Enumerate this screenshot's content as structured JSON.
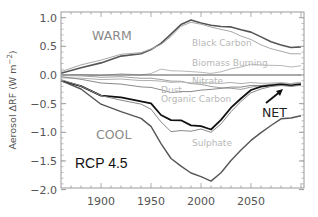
{
  "chart_data": {
    "type": "line",
    "title": "",
    "scenario_label": "RCP 4.5",
    "xlabel": "",
    "ylabel": "Aerosol ΔRF (W m⁻²)",
    "ylabel_parts": {
      "main": "Aerosol ΔRF (W m",
      "exp": "−2",
      "close": ")"
    },
    "xlim": [
      1860,
      2100
    ],
    "ylim": [
      -2.05,
      1.1
    ],
    "xticks": [
      1900,
      1950,
      2000,
      2050
    ],
    "xtick_labels": [
      "1900",
      "1950",
      "2000",
      "2050"
    ],
    "yticks": [
      1.0,
      0.5,
      0.0,
      -0.5,
      -1.0,
      -1.5,
      -2.0
    ],
    "ytick_labels": [
      "1.0",
      "0.5",
      "0.0",
      "−0.5",
      "−1.0",
      "−1.5",
      "−2.0"
    ],
    "grid": false,
    "legend": "inline labels",
    "annotations": [
      {
        "text": "WARM",
        "x": 1893,
        "y": 0.65,
        "role": "warm-total"
      },
      {
        "text": "COOL",
        "x": 1898,
        "y": -1.1,
        "role": "cool-total"
      },
      {
        "text": "NET",
        "x": 2060,
        "y": -0.65,
        "role": "net",
        "arrow": true
      },
      {
        "text": "Black Carbon",
        "x": 1993,
        "y": 0.55,
        "role": "series"
      },
      {
        "text": "Biomass Burning",
        "x": 1993,
        "y": 0.22,
        "role": "series"
      },
      {
        "text": "Nitrate",
        "x": 1993,
        "y": -0.12,
        "role": "series"
      },
      {
        "text": "Dust",
        "x": 1962,
        "y": -0.27,
        "role": "series"
      },
      {
        "text": "Organic Carbon",
        "x": 1962,
        "y": -0.42,
        "role": "series"
      },
      {
        "text": "Sulphate",
        "x": 1993,
        "y": -1.1,
        "role": "series"
      }
    ],
    "x": [
      1860,
      1880,
      1900,
      1920,
      1940,
      1950,
      1960,
      1970,
      1980,
      1990,
      2000,
      2010,
      2020,
      2030,
      2040,
      2050,
      2060,
      2070,
      2080,
      2090,
      2100
    ],
    "series": [
      {
        "name": "Warm (total positive)",
        "color": "#555555",
        "width": 1.6,
        "values": [
          0.03,
          0.12,
          0.22,
          0.32,
          0.38,
          0.44,
          0.55,
          0.72,
          0.87,
          0.97,
          0.9,
          0.87,
          0.85,
          0.83,
          0.8,
          0.74,
          0.67,
          0.58,
          0.52,
          0.49,
          0.48
        ]
      },
      {
        "name": "Black Carbon",
        "color": "#a8a8a8",
        "width": 1.0,
        "values": [
          0.06,
          0.17,
          0.27,
          0.35,
          0.4,
          0.45,
          0.53,
          0.68,
          0.84,
          0.93,
          0.88,
          0.84,
          0.8,
          0.75,
          0.69,
          0.61,
          0.53,
          0.46,
          0.41,
          0.38,
          0.36
        ]
      },
      {
        "name": "Biomass Burning",
        "color": "#b8b8b8",
        "width": 1.0,
        "values": [
          0.0,
          0.0,
          0.0,
          0.01,
          0.01,
          0.02,
          0.1,
          0.08,
          0.06,
          0.07,
          0.04,
          0.03,
          0.06,
          0.1,
          0.15,
          0.18,
          0.18,
          0.17,
          0.16,
          0.15,
          0.15
        ]
      },
      {
        "name": "Zero",
        "color": "#555555",
        "width": 1.2,
        "values": [
          0,
          0,
          0,
          0,
          0,
          0,
          0,
          0,
          0,
          0,
          0,
          0,
          0,
          0,
          0,
          0,
          0,
          0,
          0,
          0,
          0
        ]
      },
      {
        "name": "Nitrate",
        "color": "#a0a0a0",
        "width": 1.0,
        "values": [
          -0.01,
          -0.02,
          -0.03,
          -0.04,
          -0.05,
          -0.06,
          -0.08,
          -0.1,
          -0.12,
          -0.14,
          -0.17,
          -0.2,
          -0.22,
          -0.24,
          -0.24,
          -0.22,
          -0.18,
          -0.16,
          -0.15,
          -0.14,
          -0.14
        ]
      },
      {
        "name": "Dust",
        "color": "#b0b0b0",
        "width": 1.0,
        "values": [
          -0.05,
          -0.06,
          -0.07,
          -0.08,
          -0.09,
          -0.1,
          -0.11,
          -0.12,
          -0.13,
          -0.13,
          -0.14,
          -0.14,
          -0.14,
          -0.14,
          -0.14,
          -0.14,
          -0.14,
          -0.14,
          -0.14,
          -0.14,
          -0.14
        ]
      },
      {
        "name": "Organic Carbon",
        "color": "#8a8a8a",
        "width": 1.0,
        "values": [
          -0.03,
          -0.08,
          -0.13,
          -0.17,
          -0.2,
          -0.22,
          -0.26,
          -0.3,
          -0.3,
          -0.28,
          -0.27,
          -0.25,
          -0.23,
          -0.22,
          -0.2,
          -0.19,
          -0.18,
          -0.18,
          -0.18,
          -0.18,
          -0.18
        ]
      },
      {
        "name": "NET",
        "color": "#111111",
        "width": 1.8,
        "values": [
          -0.1,
          -0.2,
          -0.35,
          -0.4,
          -0.45,
          -0.5,
          -0.7,
          -0.78,
          -0.8,
          -0.87,
          -0.9,
          -0.95,
          -0.78,
          -0.58,
          -0.4,
          -0.27,
          -0.2,
          -0.18,
          -0.17,
          -0.17,
          -0.17
        ]
      },
      {
        "name": "Sulphate",
        "color": "#888888",
        "width": 1.0,
        "values": [
          -0.08,
          -0.2,
          -0.35,
          -0.45,
          -0.5,
          -0.6,
          -0.82,
          -0.98,
          -0.98,
          -0.97,
          -0.95,
          -1.0,
          -0.85,
          -0.65,
          -0.45,
          -0.32,
          -0.24,
          -0.2,
          -0.19,
          -0.19,
          -0.19
        ]
      },
      {
        "name": "Cool (total negative)",
        "color": "#555555",
        "width": 1.4,
        "values": [
          -0.1,
          -0.25,
          -0.5,
          -0.65,
          -0.75,
          -0.9,
          -1.2,
          -1.45,
          -1.6,
          -1.7,
          -1.78,
          -1.85,
          -1.7,
          -1.5,
          -1.3,
          -1.15,
          -1.0,
          -0.88,
          -0.77,
          -0.74,
          -0.72
        ]
      }
    ]
  }
}
